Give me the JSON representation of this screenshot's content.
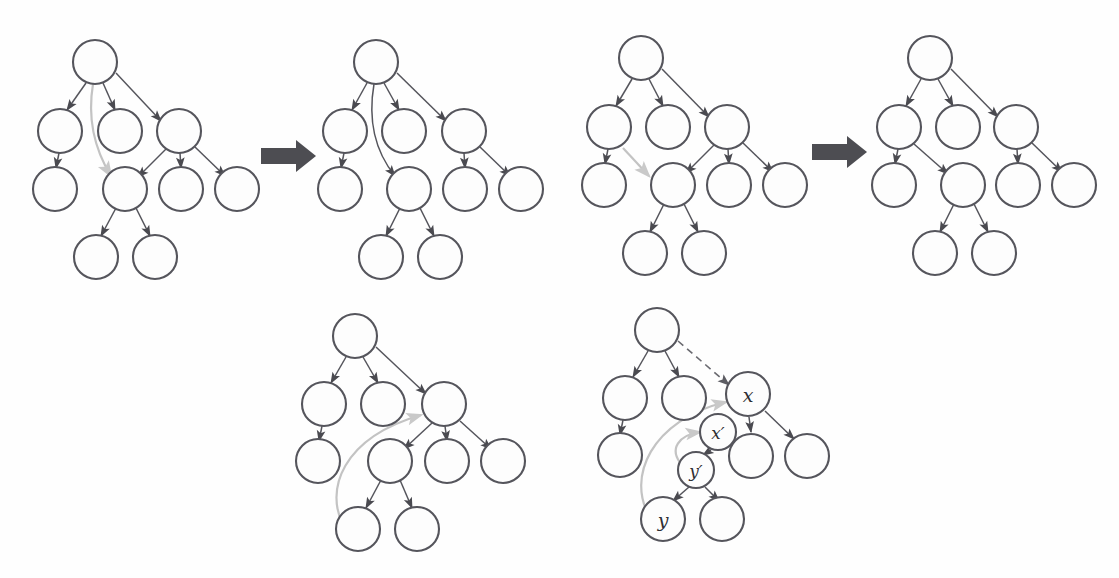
{
  "figure": {
    "background_color": "#fefefe",
    "node_stroke_color": "#55555c",
    "node_fill_color": "#fdfdfd",
    "edge_color": "#55555c",
    "highlight_edge_color": "#c3c3c3",
    "dashed_edge_color": "#6a6a70",
    "block_arrow_color": "#4d4d52",
    "node_radius": 22,
    "small_node_radius": 18
  },
  "panels": [
    {
      "id": "panel-1",
      "name": "tree-before-first-transform",
      "row": "top",
      "order": 1,
      "nodes": [
        {
          "id": "r",
          "cx": 95,
          "cy": 62,
          "r": 22,
          "label": ""
        },
        {
          "id": "a",
          "cx": 60,
          "cy": 131,
          "r": 22,
          "label": ""
        },
        {
          "id": "b",
          "cx": 120,
          "cy": 131,
          "r": 22,
          "label": ""
        },
        {
          "id": "c",
          "cx": 179,
          "cy": 131,
          "r": 22,
          "label": ""
        },
        {
          "id": "d",
          "cx": 55,
          "cy": 189,
          "r": 22,
          "label": ""
        },
        {
          "id": "e",
          "cx": 125,
          "cy": 189,
          "r": 22,
          "label": ""
        },
        {
          "id": "f",
          "cx": 181,
          "cy": 189,
          "r": 22,
          "label": ""
        },
        {
          "id": "g",
          "cx": 237,
          "cy": 189,
          "r": 22,
          "label": ""
        },
        {
          "id": "h",
          "cx": 96,
          "cy": 257,
          "r": 22,
          "label": ""
        },
        {
          "id": "i",
          "cx": 155,
          "cy": 257,
          "r": 22,
          "label": ""
        }
      ],
      "edges": [
        {
          "from": "r",
          "to": "a",
          "style": "solid"
        },
        {
          "from": "r",
          "to": "b",
          "style": "solid"
        },
        {
          "from": "r",
          "to": "c",
          "style": "solid"
        },
        {
          "from": "a",
          "to": "d",
          "style": "solid"
        },
        {
          "from": "c",
          "to": "e",
          "style": "solid"
        },
        {
          "from": "c",
          "to": "f",
          "style": "solid"
        },
        {
          "from": "c",
          "to": "g",
          "style": "solid"
        },
        {
          "from": "e",
          "to": "h",
          "style": "solid"
        },
        {
          "from": "e",
          "to": "i",
          "style": "solid"
        },
        {
          "from": "r",
          "to": "e",
          "style": "gray-curve"
        }
      ]
    },
    {
      "id": "panel-2",
      "name": "tree-after-first-transform",
      "row": "top",
      "order": 2,
      "nodes": [
        {
          "id": "r",
          "cx": 376,
          "cy": 62,
          "r": 22,
          "label": ""
        },
        {
          "id": "a",
          "cx": 345,
          "cy": 131,
          "r": 22,
          "label": ""
        },
        {
          "id": "b",
          "cx": 404,
          "cy": 131,
          "r": 22,
          "label": ""
        },
        {
          "id": "c",
          "cx": 464,
          "cy": 131,
          "r": 22,
          "label": ""
        },
        {
          "id": "d",
          "cx": 340,
          "cy": 189,
          "r": 22,
          "label": ""
        },
        {
          "id": "e",
          "cx": 409,
          "cy": 189,
          "r": 22,
          "label": ""
        },
        {
          "id": "f",
          "cx": 465,
          "cy": 189,
          "r": 22,
          "label": ""
        },
        {
          "id": "g",
          "cx": 521,
          "cy": 189,
          "r": 22,
          "label": ""
        },
        {
          "id": "h",
          "cx": 381,
          "cy": 257,
          "r": 22,
          "label": ""
        },
        {
          "id": "i",
          "cx": 440,
          "cy": 257,
          "r": 22,
          "label": ""
        }
      ],
      "edges": [
        {
          "from": "r",
          "to": "a",
          "style": "solid"
        },
        {
          "from": "r",
          "to": "b",
          "style": "solid"
        },
        {
          "from": "r",
          "to": "c",
          "style": "solid"
        },
        {
          "from": "a",
          "to": "d",
          "style": "solid"
        },
        {
          "from": "r",
          "to": "e",
          "style": "solid-curve"
        },
        {
          "from": "c",
          "to": "f",
          "style": "solid"
        },
        {
          "from": "c",
          "to": "g",
          "style": "solid"
        },
        {
          "from": "e",
          "to": "h",
          "style": "solid"
        },
        {
          "from": "e",
          "to": "i",
          "style": "solid"
        }
      ]
    },
    {
      "id": "panel-3",
      "name": "tree-before-second-transform",
      "row": "top",
      "order": 3,
      "nodes": [
        {
          "id": "r",
          "cx": 641,
          "cy": 58,
          "r": 22,
          "label": ""
        },
        {
          "id": "a",
          "cx": 609,
          "cy": 127,
          "r": 22,
          "label": ""
        },
        {
          "id": "b",
          "cx": 668,
          "cy": 127,
          "r": 22,
          "label": ""
        },
        {
          "id": "c",
          "cx": 727,
          "cy": 127,
          "r": 22,
          "label": ""
        },
        {
          "id": "d",
          "cx": 604,
          "cy": 185,
          "r": 22,
          "label": ""
        },
        {
          "id": "e",
          "cx": 673,
          "cy": 185,
          "r": 22,
          "label": ""
        },
        {
          "id": "f",
          "cx": 729,
          "cy": 185,
          "r": 22,
          "label": ""
        },
        {
          "id": "g",
          "cx": 785,
          "cy": 185,
          "r": 22,
          "label": ""
        },
        {
          "id": "h",
          "cx": 645,
          "cy": 253,
          "r": 22,
          "label": ""
        },
        {
          "id": "i",
          "cx": 704,
          "cy": 253,
          "r": 22,
          "label": ""
        }
      ],
      "edges": [
        {
          "from": "r",
          "to": "a",
          "style": "solid"
        },
        {
          "from": "r",
          "to": "b",
          "style": "solid"
        },
        {
          "from": "r",
          "to": "c",
          "style": "solid"
        },
        {
          "from": "a",
          "to": "d",
          "style": "solid"
        },
        {
          "from": "c",
          "to": "e",
          "style": "solid"
        },
        {
          "from": "c",
          "to": "f",
          "style": "solid"
        },
        {
          "from": "c",
          "to": "g",
          "style": "solid"
        },
        {
          "from": "e",
          "to": "h",
          "style": "solid"
        },
        {
          "from": "e",
          "to": "i",
          "style": "solid"
        },
        {
          "from": "a",
          "to": "e",
          "style": "gray-straight"
        }
      ]
    },
    {
      "id": "panel-4",
      "name": "tree-after-second-transform",
      "row": "top",
      "order": 4,
      "nodes": [
        {
          "id": "r",
          "cx": 930,
          "cy": 58,
          "r": 22,
          "label": ""
        },
        {
          "id": "a",
          "cx": 899,
          "cy": 127,
          "r": 22,
          "label": ""
        },
        {
          "id": "b",
          "cx": 958,
          "cy": 127,
          "r": 22,
          "label": ""
        },
        {
          "id": "c",
          "cx": 1016,
          "cy": 127,
          "r": 22,
          "label": ""
        },
        {
          "id": "d",
          "cx": 894,
          "cy": 185,
          "r": 22,
          "label": ""
        },
        {
          "id": "e",
          "cx": 963,
          "cy": 185,
          "r": 22,
          "label": ""
        },
        {
          "id": "f",
          "cx": 1018,
          "cy": 185,
          "r": 22,
          "label": ""
        },
        {
          "id": "g",
          "cx": 1074,
          "cy": 185,
          "r": 22,
          "label": ""
        },
        {
          "id": "h",
          "cx": 935,
          "cy": 253,
          "r": 22,
          "label": ""
        },
        {
          "id": "i",
          "cx": 994,
          "cy": 253,
          "r": 22,
          "label": ""
        }
      ],
      "edges": [
        {
          "from": "r",
          "to": "a",
          "style": "solid"
        },
        {
          "from": "r",
          "to": "b",
          "style": "solid"
        },
        {
          "from": "r",
          "to": "c",
          "style": "solid"
        },
        {
          "from": "a",
          "to": "d",
          "style": "solid"
        },
        {
          "from": "a",
          "to": "e",
          "style": "solid"
        },
        {
          "from": "c",
          "to": "f",
          "style": "solid"
        },
        {
          "from": "c",
          "to": "g",
          "style": "solid"
        },
        {
          "from": "e",
          "to": "h",
          "style": "solid"
        },
        {
          "from": "e",
          "to": "i",
          "style": "solid"
        }
      ]
    },
    {
      "id": "panel-5",
      "name": "tree-long-back-edge-unlabeled",
      "row": "bottom",
      "order": 5,
      "nodes": [
        {
          "id": "r",
          "cx": 355,
          "cy": 336,
          "r": 22,
          "label": ""
        },
        {
          "id": "a",
          "cx": 324,
          "cy": 404,
          "r": 22,
          "label": ""
        },
        {
          "id": "b",
          "cx": 383,
          "cy": 404,
          "r": 22,
          "label": ""
        },
        {
          "id": "c",
          "cx": 444,
          "cy": 404,
          "r": 22,
          "label": ""
        },
        {
          "id": "d",
          "cx": 318,
          "cy": 461,
          "r": 22,
          "label": ""
        },
        {
          "id": "e",
          "cx": 390,
          "cy": 461,
          "r": 22,
          "label": ""
        },
        {
          "id": "f",
          "cx": 447,
          "cy": 461,
          "r": 22,
          "label": ""
        },
        {
          "id": "g",
          "cx": 503,
          "cy": 461,
          "r": 22,
          "label": ""
        },
        {
          "id": "h",
          "cx": 358,
          "cy": 529,
          "r": 22,
          "label": ""
        },
        {
          "id": "i",
          "cx": 417,
          "cy": 529,
          "r": 22,
          "label": ""
        }
      ],
      "edges": [
        {
          "from": "r",
          "to": "a",
          "style": "solid"
        },
        {
          "from": "r",
          "to": "b",
          "style": "solid"
        },
        {
          "from": "r",
          "to": "c",
          "style": "solid"
        },
        {
          "from": "a",
          "to": "d",
          "style": "solid"
        },
        {
          "from": "c",
          "to": "e",
          "style": "solid"
        },
        {
          "from": "c",
          "to": "f",
          "style": "solid"
        },
        {
          "from": "c",
          "to": "g",
          "style": "solid"
        },
        {
          "from": "e",
          "to": "h",
          "style": "solid"
        },
        {
          "from": "e",
          "to": "i",
          "style": "solid"
        },
        {
          "from": "h",
          "to": "c",
          "style": "gray-long-curve"
        }
      ]
    },
    {
      "id": "panel-6",
      "name": "tree-long-back-edge-labeled",
      "row": "bottom",
      "order": 6,
      "nodes": [
        {
          "id": "r",
          "cx": 657,
          "cy": 330,
          "r": 22,
          "label": ""
        },
        {
          "id": "a",
          "cx": 625,
          "cy": 398,
          "r": 22,
          "label": ""
        },
        {
          "id": "b",
          "cx": 684,
          "cy": 398,
          "r": 22,
          "label": ""
        },
        {
          "id": "x",
          "cx": 748,
          "cy": 394,
          "r": 22,
          "label": "x"
        },
        {
          "id": "d",
          "cx": 620,
          "cy": 455,
          "r": 22,
          "label": ""
        },
        {
          "id": "xp",
          "cx": 718,
          "cy": 432,
          "r": 18,
          "label": "x′"
        },
        {
          "id": "f",
          "cx": 751,
          "cy": 456,
          "r": 22,
          "label": ""
        },
        {
          "id": "g",
          "cx": 807,
          "cy": 456,
          "r": 22,
          "label": ""
        },
        {
          "id": "yp",
          "cx": 696,
          "cy": 470,
          "r": 18,
          "label": "y′"
        },
        {
          "id": "y",
          "cx": 663,
          "cy": 519,
          "r": 22,
          "label": "y"
        },
        {
          "id": "i",
          "cx": 722,
          "cy": 519,
          "r": 22,
          "label": ""
        }
      ],
      "edges": [
        {
          "from": "r",
          "to": "a",
          "style": "solid"
        },
        {
          "from": "r",
          "to": "b",
          "style": "solid"
        },
        {
          "from": "r",
          "to": "x",
          "style": "dashed"
        },
        {
          "from": "a",
          "to": "d",
          "style": "solid"
        },
        {
          "from": "x",
          "to": "f",
          "style": "solid"
        },
        {
          "from": "x",
          "to": "g",
          "style": "solid"
        },
        {
          "from": "xp",
          "to": "yp",
          "style": "solid"
        },
        {
          "from": "yp",
          "to": "y",
          "style": "solid"
        },
        {
          "from": "yp",
          "to": "i",
          "style": "solid"
        },
        {
          "from": "y",
          "to": "x",
          "style": "gray-long-curve"
        },
        {
          "from": "yp",
          "to": "xp",
          "style": "gray-short-curve"
        }
      ],
      "labels": [
        {
          "node": "x",
          "text": "x"
        },
        {
          "node": "xp",
          "text": "x′"
        },
        {
          "node": "yp",
          "text": "y′"
        },
        {
          "node": "y",
          "text": "y"
        }
      ]
    }
  ],
  "transform_arrows": [
    {
      "id": "arrow-1",
      "name": "transform-arrow-first",
      "x": 261,
      "y": 140,
      "width": 55,
      "height": 32
    },
    {
      "id": "arrow-2",
      "name": "transform-arrow-second",
      "x": 812,
      "y": 136,
      "width": 55,
      "height": 32
    }
  ]
}
